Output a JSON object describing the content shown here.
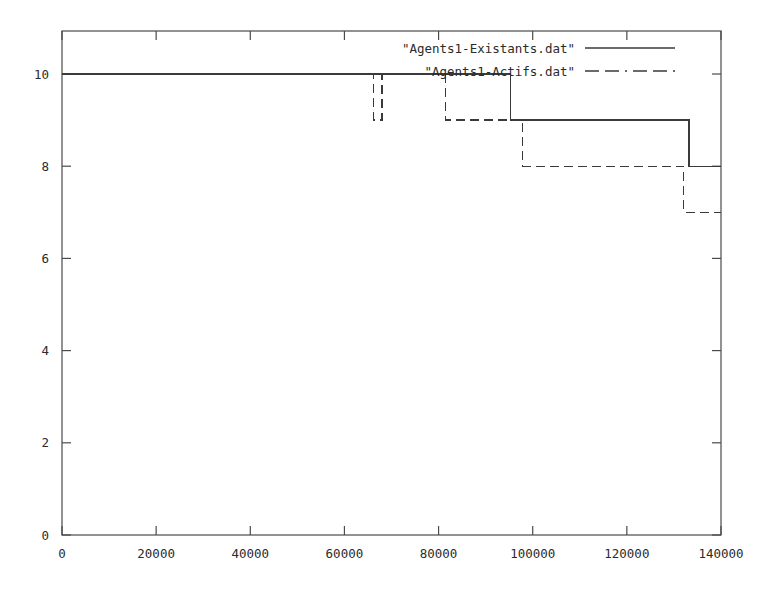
{
  "chart_data": {
    "type": "line",
    "title": "",
    "xlabel": "",
    "ylabel": "",
    "xlim": [
      0,
      140000
    ],
    "ylim": [
      0,
      10.4
    ],
    "grid": false,
    "legend_position": "top-right",
    "xticks": [
      0,
      20000,
      40000,
      60000,
      80000,
      100000,
      120000,
      140000
    ],
    "xtick_labels": [
      "0",
      "20000",
      "40000",
      "60000",
      "80000",
      "100000",
      "120000",
      "140000"
    ],
    "yticks": [
      0,
      2,
      4,
      6,
      8,
      10
    ],
    "ytick_labels": [
      "0",
      "2",
      "4",
      "6",
      "8",
      "10"
    ],
    "series": [
      {
        "name": "\"Agents1-Existants.dat\"",
        "style": "solid",
        "color": "#3a3a3a",
        "step": true,
        "points": [
          {
            "x": 0,
            "y": 10
          },
          {
            "x": 95300,
            "y": 10
          },
          {
            "x": 95300,
            "y": 9
          },
          {
            "x": 133200,
            "y": 9
          },
          {
            "x": 133200,
            "y": 8
          },
          {
            "x": 140000,
            "y": 8
          }
        ]
      },
      {
        "name": "\"Agents1-Actifs.dat\"",
        "style": "dashed",
        "color": "#3a3a3a",
        "step": true,
        "points": [
          {
            "x": 0,
            "y": 10
          },
          {
            "x": 66200,
            "y": 10
          },
          {
            "x": 66200,
            "y": 9
          },
          {
            "x": 68000,
            "y": 9
          },
          {
            "x": 68000,
            "y": 10
          },
          {
            "x": 81500,
            "y": 10
          },
          {
            "x": 81500,
            "y": 9
          },
          {
            "x": 97900,
            "y": 9
          },
          {
            "x": 97900,
            "y": 8
          },
          {
            "x": 132100,
            "y": 8
          },
          {
            "x": 132100,
            "y": 7
          },
          {
            "x": 140000,
            "y": 7
          }
        ]
      }
    ]
  },
  "legend": {
    "entries": [
      {
        "label": "\"Agents1-Existants.dat\"",
        "style": "solid"
      },
      {
        "label": "\"Agents1-Actifs.dat\"",
        "style": "dashed"
      }
    ]
  },
  "axes": {
    "frame_color": "#4a4a4a"
  }
}
